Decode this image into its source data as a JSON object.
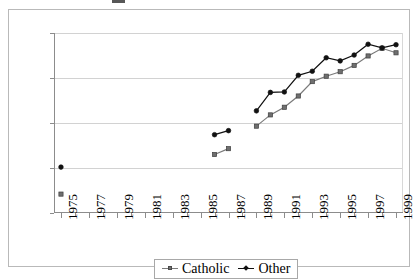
{
  "chart_data": {
    "type": "line",
    "title": "",
    "xlabel": "",
    "ylabel": "",
    "xlim": [
      1974.5,
      1999.5
    ],
    "ylim": [
      20,
      60
    ],
    "ytick_labels": [
      "20",
      "30",
      "40",
      "50",
      "60"
    ],
    "ytick_values": [
      20,
      30,
      40,
      50,
      60
    ],
    "xtick_labels": [
      "1975",
      "1977",
      "1979",
      "1981",
      "1983",
      "1985",
      "1987",
      "1989",
      "1991",
      "1993",
      "1995",
      "1997",
      "1999"
    ],
    "xtick_values": [
      1975,
      1977,
      1979,
      1981,
      1983,
      1985,
      1987,
      1989,
      1991,
      1993,
      1995,
      1997,
      1999
    ],
    "xtick_minor_values": [
      1976,
      1978,
      1980,
      1982,
      1984,
      1986,
      1988,
      1990,
      1992,
      1994,
      1996,
      1998
    ],
    "grid": "horizontal",
    "legend_position": "bottom",
    "series": [
      {
        "name": "Catholic",
        "marker": "square",
        "color": "#7a7a7a",
        "marker_color": "#6f6f6f",
        "x": [
          1975,
          1986,
          1987,
          1989,
          1990,
          1991,
          1992,
          1993,
          1994,
          1995,
          1996,
          1997,
          1998,
          1999
        ],
        "values": [
          24.2,
          33.0,
          34.3,
          39.3,
          41.8,
          43.5,
          46.0,
          49.2,
          50.4,
          51.4,
          52.8,
          54.9,
          56.6,
          55.6
        ],
        "segments": [
          [
            1975
          ],
          [
            1986,
            1987
          ],
          [
            1989,
            1990,
            1991,
            1992,
            1993,
            1994,
            1995,
            1996,
            1997,
            1998,
            1999
          ]
        ]
      },
      {
        "name": "Other",
        "marker": "diamond",
        "color": "#111111",
        "marker_color": "#111111",
        "x": [
          1975,
          1986,
          1987,
          1989,
          1990,
          1991,
          1992,
          1993,
          1994,
          1995,
          1996,
          1997,
          1998,
          1999
        ],
        "values": [
          30.2,
          37.4,
          38.3,
          42.7,
          46.8,
          46.9,
          50.6,
          51.5,
          54.5,
          53.8,
          55.1,
          57.5,
          56.7,
          57.4
        ],
        "segments": [
          [
            1975
          ],
          [
            1986,
            1987
          ],
          [
            1989,
            1990,
            1991,
            1992,
            1993,
            1994,
            1995,
            1996,
            1997,
            1998,
            1999
          ]
        ]
      }
    ]
  },
  "legend": {
    "entries": [
      {
        "label": "Catholic"
      },
      {
        "label": "Other"
      }
    ]
  }
}
